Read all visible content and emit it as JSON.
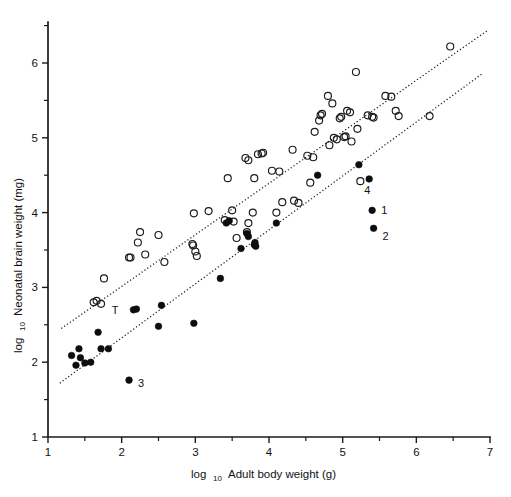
{
  "chart_data": {
    "type": "scatter",
    "title": "",
    "xlabel": "log10 Adult body weight (g)",
    "xlabel_main": "log",
    "xlabel_sub": "10",
    "xlabel_rest": "Adult body weight (g)",
    "ylabel": "log10 Neonatal brain weight (mg)",
    "ylabel_main": "log",
    "ylabel_sub": "10",
    "ylabel_rest": "Neonatal brain weight (mg)",
    "xlim": [
      1,
      7
    ],
    "ylim": [
      1,
      6.5
    ],
    "x_major_ticks": [
      1,
      2,
      3,
      4,
      5,
      6,
      7
    ],
    "x_tick_labels": [
      "1",
      "2",
      "3",
      "4",
      "5",
      "6",
      "7"
    ],
    "x_minor_ticks": [
      1.5,
      2.5,
      3.5,
      4.5,
      5.5,
      6.5
    ],
    "y_major_ticks": [
      1,
      2,
      3,
      4,
      5,
      6
    ],
    "y_tick_labels": [
      "1",
      "2",
      "3",
      "4",
      "5",
      "6"
    ],
    "y_minor_ticks": [
      1.5,
      2.5,
      3.5,
      4.5,
      5.5,
      6.5
    ],
    "grid": false,
    "legend": "none",
    "series": [
      {
        "name": "Open circles (non-human primates / precocial)",
        "marker": "open-circle",
        "marker_color": "#1a1a1a",
        "points": [
          [
            1.62,
            2.8
          ],
          [
            1.66,
            2.82
          ],
          [
            1.72,
            2.78
          ],
          [
            1.76,
            3.12
          ],
          [
            2.1,
            3.4
          ],
          [
            2.12,
            3.4
          ],
          [
            2.22,
            3.6
          ],
          [
            2.25,
            3.74
          ],
          [
            2.32,
            3.44
          ],
          [
            2.5,
            3.7
          ],
          [
            2.58,
            3.34
          ],
          [
            2.96,
            3.58
          ],
          [
            2.97,
            3.56
          ],
          [
            2.98,
            3.99
          ],
          [
            3.0,
            3.48
          ],
          [
            3.02,
            3.42
          ],
          [
            3.18,
            4.02
          ],
          [
            3.4,
            3.9
          ],
          [
            3.44,
            4.46
          ],
          [
            3.5,
            4.03
          ],
          [
            3.52,
            3.88
          ],
          [
            3.56,
            3.66
          ],
          [
            3.7,
            3.74
          ],
          [
            3.72,
            3.86
          ],
          [
            3.78,
            4.0
          ],
          [
            3.8,
            4.46
          ],
          [
            3.85,
            4.78
          ],
          [
            3.9,
            4.79
          ],
          [
            3.92,
            4.8
          ],
          [
            3.72,
            4.7
          ],
          [
            3.68,
            4.73
          ],
          [
            4.04,
            4.56
          ],
          [
            4.1,
            4.0
          ],
          [
            4.14,
            4.55
          ],
          [
            4.18,
            4.14
          ],
          [
            4.32,
            4.84
          ],
          [
            4.34,
            4.16
          ],
          [
            4.4,
            4.13
          ],
          [
            4.52,
            4.76
          ],
          [
            4.56,
            4.4
          ],
          [
            4.6,
            4.74
          ],
          [
            4.62,
            5.08
          ],
          [
            4.68,
            5.23
          ],
          [
            4.7,
            5.3
          ],
          [
            4.72,
            5.32
          ],
          [
            4.8,
            5.56
          ],
          [
            4.82,
            4.9
          ],
          [
            4.86,
            5.46
          ],
          [
            4.88,
            5.0
          ],
          [
            4.92,
            4.98
          ],
          [
            4.96,
            5.26
          ],
          [
            4.98,
            5.28
          ],
          [
            5.02,
            5.01
          ],
          [
            5.04,
            5.02
          ],
          [
            5.06,
            5.36
          ],
          [
            5.1,
            5.34
          ],
          [
            5.12,
            4.95
          ],
          [
            5.18,
            5.88
          ],
          [
            5.2,
            5.12
          ],
          [
            5.24,
            4.42
          ],
          [
            5.34,
            5.3
          ],
          [
            5.4,
            5.28
          ],
          [
            5.42,
            5.27
          ],
          [
            5.58,
            5.56
          ],
          [
            5.66,
            5.55
          ],
          [
            5.72,
            5.36
          ],
          [
            5.76,
            5.29
          ],
          [
            6.18,
            5.29
          ],
          [
            6.46,
            6.22
          ]
        ]
      },
      {
        "name": "Filled circles (altricial / haplorhine)",
        "marker": "filled-circle",
        "marker_color": "#0d0d0d",
        "points": [
          [
            1.32,
            2.09
          ],
          [
            1.38,
            1.96
          ],
          [
            1.42,
            2.18
          ],
          [
            1.44,
            2.06
          ],
          [
            1.5,
            1.99
          ],
          [
            1.58,
            2.0
          ],
          [
            1.68,
            2.4
          ],
          [
            1.72,
            2.18
          ],
          [
            1.82,
            2.18
          ],
          [
            2.1,
            1.76
          ],
          [
            2.16,
            2.7
          ],
          [
            2.2,
            2.71
          ],
          [
            2.5,
            2.48
          ],
          [
            2.54,
            2.76
          ],
          [
            2.98,
            2.52
          ],
          [
            3.34,
            3.12
          ],
          [
            3.42,
            3.86
          ],
          [
            3.46,
            3.89
          ],
          [
            3.62,
            3.52
          ],
          [
            3.7,
            3.72
          ],
          [
            3.72,
            3.68
          ],
          [
            3.8,
            3.57
          ],
          [
            3.81,
            3.6
          ],
          [
            3.82,
            3.55
          ],
          [
            4.1,
            3.86
          ],
          [
            4.66,
            4.5
          ],
          [
            5.22,
            4.64
          ],
          [
            5.36,
            4.45
          ],
          [
            5.4,
            4.03
          ],
          [
            5.42,
            3.79
          ]
        ]
      }
    ],
    "fit_lines": [
      {
        "name": "upper-regression-line",
        "style": "dotted",
        "x_start": 1.18,
        "y_start": 2.45,
        "x_end": 6.96,
        "y_end": 6.43
      },
      {
        "name": "lower-regression-line",
        "style": "dotted",
        "x_start": 1.16,
        "y_start": 1.72,
        "x_end": 6.9,
        "y_end": 5.86
      }
    ],
    "annotations": [
      {
        "label": "1",
        "x": 5.4,
        "y": 4.03,
        "dx": 9,
        "dy": 4,
        "target": "filled-circle"
      },
      {
        "label": "2",
        "x": 5.42,
        "y": 3.79,
        "dx": 9,
        "dy": 12,
        "target": "filled-circle"
      },
      {
        "label": "3",
        "x": 2.1,
        "y": 1.76,
        "dx": 9,
        "dy": 7,
        "target": "filled-circle"
      },
      {
        "label": "4",
        "x": 5.24,
        "y": 4.42,
        "dx": 4,
        "dy": 13,
        "target": "open-circle"
      },
      {
        "label": "T",
        "x": 2.16,
        "y": 2.7,
        "dx": -15,
        "dy": 4,
        "target": "filled-circle"
      }
    ]
  },
  "figure": {
    "background_color": "#ffffff",
    "axis_color": "#1a1a1a",
    "marker_open_color": "#1a1a1a",
    "marker_filled_color": "#0d0d0d"
  }
}
